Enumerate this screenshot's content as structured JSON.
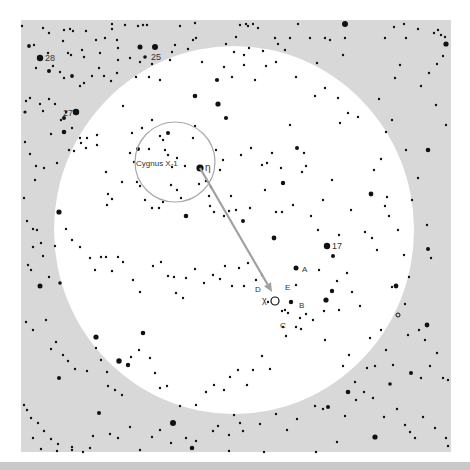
{
  "colors": {
    "sky_field": "#d8d8d8",
    "view_circle": "#ffffff",
    "star": "#111111",
    "marker_circle": "#a8a8a8",
    "arrow": "#a0a0a0",
    "label": "#333333",
    "bottom_strip": "#c9c9c9"
  },
  "field": {
    "x": 21,
    "y": 20,
    "width": 430,
    "height": 432
  },
  "view_circle": {
    "cx": 234,
    "cy": 230,
    "rx": 180,
    "ry": 184
  },
  "cygnus_circle": {
    "cx": 175,
    "cy": 162,
    "r": 40
  },
  "motion_arrow": {
    "x1": 200,
    "y1": 168,
    "x2": 272,
    "y2": 292
  },
  "labels": {
    "star_28": "28",
    "star_25": "25",
    "star_27": "27",
    "star_17": "17",
    "cygnus_x1": "Cygnus X-1",
    "eta": "η",
    "chi": "χ",
    "A": "A",
    "B": "B",
    "C": "C",
    "D": "D",
    "E": "E"
  },
  "label_positions": {
    "star_28": {
      "x": 45,
      "y": 61,
      "size": 9
    },
    "star_25": {
      "x": 151,
      "y": 60,
      "size": 9
    },
    "star_27": {
      "x": 63,
      "y": 116,
      "size": 9
    },
    "star_17": {
      "x": 332,
      "y": 249,
      "size": 9
    },
    "cygnus_x1": {
      "x": 136,
      "y": 166,
      "size": 8
    },
    "eta": {
      "x": 205,
      "y": 171,
      "size": 10
    },
    "chi": {
      "x": 262,
      "y": 303,
      "size": 9
    },
    "A": {
      "x": 302,
      "y": 272,
      "size": 8
    },
    "B": {
      "x": 299,
      "y": 308,
      "size": 8
    },
    "C": {
      "x": 280,
      "y": 328,
      "size": 8
    },
    "D": {
      "x": 255,
      "y": 292,
      "size": 8
    },
    "E": {
      "x": 285,
      "y": 290,
      "size": 8
    }
  },
  "chi_marker": {
    "cx": 275,
    "cy": 301,
    "r": 4
  },
  "open_star": {
    "cx": 398,
    "cy": 315,
    "r": 2
  },
  "bright_stars": [
    [
      40,
      58,
      3.2
    ],
    [
      155,
      47,
      3
    ],
    [
      76,
      112,
      3.2
    ],
    [
      200,
      168,
      3.6
    ],
    [
      327,
      246,
      3.2
    ],
    [
      296,
      268,
      2.5
    ],
    [
      326,
      300,
      2.6
    ],
    [
      291,
      302,
      2.2
    ],
    [
      345,
      24,
      3
    ],
    [
      446,
      44,
      2.6
    ],
    [
      428,
      150,
      2.3
    ],
    [
      371,
      194,
      2.4
    ],
    [
      333,
      256,
      2
    ],
    [
      140,
      47,
      2.5
    ],
    [
      64,
      118,
      2
    ],
    [
      218,
      104,
      2.6
    ],
    [
      195,
      96,
      2.3
    ],
    [
      59,
      212,
      2.6
    ],
    [
      40,
      286,
      2.5
    ],
    [
      96,
      337,
      2.6
    ],
    [
      119,
      361,
      2.7
    ],
    [
      173,
      423,
      3
    ],
    [
      99,
      413,
      2
    ],
    [
      192,
      448,
      2.3
    ],
    [
      375,
      437,
      2.6
    ],
    [
      348,
      392,
      2.3
    ],
    [
      396,
      286,
      2.4
    ],
    [
      427,
      325,
      2.4
    ],
    [
      332,
      291,
      2.2
    ],
    [
      168,
      133,
      2
    ],
    [
      138,
      149,
      2
    ],
    [
      60,
      283,
      1.8
    ],
    [
      274,
      238,
      2.4
    ],
    [
      186,
      216,
      2.3
    ],
    [
      243,
      221,
      2
    ],
    [
      297,
      148,
      2
    ],
    [
      283,
      183,
      2.2
    ],
    [
      59,
      378,
      2
    ],
    [
      128,
      365,
      2.2
    ],
    [
      143,
      333,
      2.3
    ],
    [
      328,
      407,
      2
    ],
    [
      411,
      373,
      2
    ],
    [
      428,
      249,
      2
    ],
    [
      390,
      384,
      1.8
    ],
    [
      64,
      132,
      2.3
    ],
    [
      49,
      71,
      2
    ],
    [
      72,
      76,
      1.9
    ],
    [
      226,
      118,
      2.1
    ],
    [
      217,
      80,
      2.1
    ],
    [
      145,
      57,
      1.8
    ],
    [
      29,
      46,
      1.9
    ],
    [
      25,
      112,
      1.6
    ]
  ],
  "stars": [
    [
      22,
      26
    ],
    [
      43,
      28
    ],
    [
      49,
      33
    ],
    [
      64,
      30
    ],
    [
      70,
      29
    ],
    [
      73,
      31
    ],
    [
      86,
      31
    ],
    [
      112,
      24
    ],
    [
      112,
      29
    ],
    [
      125,
      25
    ],
    [
      138,
      26
    ],
    [
      143,
      25
    ],
    [
      147,
      25
    ],
    [
      180,
      26
    ],
    [
      195,
      23
    ],
    [
      196,
      38
    ],
    [
      240,
      25
    ],
    [
      246,
      24
    ],
    [
      248,
      26
    ],
    [
      253,
      24
    ],
    [
      258,
      28
    ],
    [
      298,
      24
    ],
    [
      275,
      38
    ],
    [
      310,
      38
    ],
    [
      325,
      38
    ],
    [
      330,
      40
    ],
    [
      345,
      38
    ],
    [
      385,
      38
    ],
    [
      394,
      27
    ],
    [
      404,
      24
    ],
    [
      406,
      38
    ],
    [
      418,
      29
    ],
    [
      434,
      33
    ],
    [
      438,
      30
    ],
    [
      441,
      35
    ],
    [
      445,
      37
    ],
    [
      34,
      45
    ],
    [
      48,
      53
    ],
    [
      63,
      41
    ],
    [
      68,
      53
    ],
    [
      82,
      50
    ],
    [
      84,
      57
    ],
    [
      71,
      55
    ],
    [
      96,
      40
    ],
    [
      100,
      53
    ],
    [
      105,
      38
    ],
    [
      117,
      40
    ],
    [
      118,
      48
    ],
    [
      140,
      62
    ],
    [
      175,
      45
    ],
    [
      188,
      49
    ],
    [
      193,
      40
    ],
    [
      226,
      44
    ],
    [
      234,
      52
    ],
    [
      236,
      37
    ],
    [
      244,
      55
    ],
    [
      249,
      48
    ],
    [
      263,
      51
    ],
    [
      278,
      44
    ],
    [
      285,
      50
    ],
    [
      290,
      38
    ],
    [
      317,
      63
    ],
    [
      325,
      88
    ],
    [
      343,
      55
    ],
    [
      400,
      65
    ],
    [
      395,
      78
    ],
    [
      443,
      56
    ],
    [
      437,
      64
    ],
    [
      436,
      105
    ],
    [
      446,
      125
    ],
    [
      429,
      73
    ],
    [
      421,
      86
    ],
    [
      36,
      68
    ],
    [
      53,
      66
    ],
    [
      60,
      72
    ],
    [
      64,
      78
    ],
    [
      80,
      86
    ],
    [
      84,
      83
    ],
    [
      92,
      76
    ],
    [
      99,
      68
    ],
    [
      104,
      76
    ],
    [
      111,
      81
    ],
    [
      117,
      73
    ],
    [
      136,
      77
    ],
    [
      149,
      77
    ],
    [
      160,
      80
    ],
    [
      170,
      60
    ],
    [
      172,
      52
    ],
    [
      130,
      58
    ],
    [
      118,
      60
    ],
    [
      152,
      64
    ],
    [
      202,
      62
    ],
    [
      224,
      67
    ],
    [
      232,
      77
    ],
    [
      244,
      65
    ],
    [
      255,
      80
    ],
    [
      266,
      66
    ],
    [
      276,
      62
    ],
    [
      296,
      77
    ],
    [
      315,
      96
    ],
    [
      338,
      98
    ],
    [
      340,
      123
    ],
    [
      348,
      113
    ],
    [
      358,
      117
    ],
    [
      379,
      99
    ],
    [
      392,
      120
    ],
    [
      386,
      132
    ],
    [
      406,
      150
    ],
    [
      418,
      178
    ],
    [
      412,
      200
    ],
    [
      427,
      225
    ],
    [
      431,
      258
    ],
    [
      409,
      277
    ],
    [
      26,
      101
    ],
    [
      30,
      98
    ],
    [
      40,
      104
    ],
    [
      49,
      99
    ],
    [
      43,
      111
    ],
    [
      55,
      104
    ],
    [
      61,
      120
    ],
    [
      66,
      112
    ],
    [
      72,
      128
    ],
    [
      80,
      138
    ],
    [
      87,
      138
    ],
    [
      97,
      135
    ],
    [
      123,
      106
    ],
    [
      132,
      133
    ],
    [
      142,
      128
    ],
    [
      149,
      149
    ],
    [
      152,
      120
    ],
    [
      160,
      136
    ],
    [
      163,
      140
    ],
    [
      165,
      150
    ],
    [
      168,
      155
    ],
    [
      172,
      167
    ],
    [
      177,
      158
    ],
    [
      185,
      166
    ],
    [
      193,
      138
    ],
    [
      195,
      126
    ],
    [
      206,
      181
    ],
    [
      209,
      196
    ],
    [
      211,
      187
    ],
    [
      216,
      150
    ],
    [
      220,
      170
    ],
    [
      223,
      160
    ],
    [
      231,
      196
    ],
    [
      241,
      155
    ],
    [
      251,
      148
    ],
    [
      262,
      165
    ],
    [
      267,
      163
    ],
    [
      272,
      153
    ],
    [
      281,
      168
    ],
    [
      290,
      125
    ],
    [
      304,
      153
    ],
    [
      306,
      166
    ],
    [
      302,
      172
    ],
    [
      323,
      200
    ],
    [
      332,
      180
    ],
    [
      339,
      235
    ],
    [
      347,
      273
    ],
    [
      374,
      170
    ],
    [
      381,
      159
    ],
    [
      387,
      197
    ],
    [
      385,
      206
    ],
    [
      389,
      216
    ],
    [
      398,
      230
    ],
    [
      404,
      255
    ],
    [
      25,
      142
    ],
    [
      30,
      154
    ],
    [
      36,
      166
    ],
    [
      35,
      180
    ],
    [
      24,
      198
    ],
    [
      44,
      168
    ],
    [
      51,
      134
    ],
    [
      57,
      163
    ],
    [
      69,
      150
    ],
    [
      74,
      151
    ],
    [
      81,
      143
    ],
    [
      86,
      148
    ],
    [
      97,
      145
    ],
    [
      106,
      172
    ],
    [
      108,
      194
    ],
    [
      107,
      205
    ],
    [
      112,
      199
    ],
    [
      122,
      182
    ],
    [
      130,
      153
    ],
    [
      134,
      162
    ],
    [
      137,
      182
    ],
    [
      140,
      186
    ],
    [
      145,
      200
    ],
    [
      152,
      208
    ],
    [
      159,
      208
    ],
    [
      163,
      202
    ],
    [
      171,
      185
    ],
    [
      177,
      190
    ],
    [
      181,
      198
    ],
    [
      199,
      184
    ],
    [
      210,
      206
    ],
    [
      214,
      212
    ],
    [
      224,
      216
    ],
    [
      229,
      211
    ],
    [
      236,
      210
    ],
    [
      250,
      208
    ],
    [
      265,
      190
    ],
    [
      276,
      212
    ],
    [
      282,
      212
    ],
    [
      293,
      205
    ],
    [
      311,
      216
    ],
    [
      318,
      230
    ],
    [
      351,
      210
    ],
    [
      365,
      232
    ],
    [
      372,
      238
    ],
    [
      377,
      250
    ],
    [
      27,
      221
    ],
    [
      33,
      229
    ],
    [
      37,
      230
    ],
    [
      41,
      243
    ],
    [
      43,
      256
    ],
    [
      33,
      247
    ],
    [
      28,
      265
    ],
    [
      31,
      270
    ],
    [
      49,
      277
    ],
    [
      55,
      246
    ],
    [
      66,
      229
    ],
    [
      72,
      240
    ],
    [
      80,
      247
    ],
    [
      90,
      258
    ],
    [
      95,
      270
    ],
    [
      101,
      257
    ],
    [
      106,
      257
    ],
    [
      112,
      271
    ],
    [
      118,
      257
    ],
    [
      123,
      262
    ],
    [
      133,
      280
    ],
    [
      140,
      292
    ],
    [
      153,
      266
    ],
    [
      161,
      262
    ],
    [
      168,
      276
    ],
    [
      174,
      277
    ],
    [
      176,
      293
    ],
    [
      183,
      298
    ],
    [
      186,
      278
    ],
    [
      195,
      269
    ],
    [
      204,
      283
    ],
    [
      213,
      275
    ],
    [
      220,
      279
    ],
    [
      225,
      266
    ],
    [
      232,
      286
    ],
    [
      239,
      268
    ],
    [
      244,
      286
    ],
    [
      248,
      263
    ],
    [
      256,
      280
    ],
    [
      262,
      275
    ],
    [
      268,
      302
    ],
    [
      282,
      311
    ],
    [
      285,
      310
    ],
    [
      296,
      285
    ],
    [
      300,
      318
    ],
    [
      306,
      314
    ],
    [
      319,
      270
    ],
    [
      324,
      311
    ],
    [
      337,
      281
    ],
    [
      339,
      310
    ],
    [
      352,
      292
    ],
    [
      360,
      306
    ],
    [
      370,
      338
    ],
    [
      392,
      287
    ],
    [
      405,
      304
    ],
    [
      408,
      335
    ],
    [
      419,
      330
    ],
    [
      425,
      340
    ],
    [
      26,
      322
    ],
    [
      33,
      330
    ],
    [
      46,
      320
    ],
    [
      51,
      349
    ],
    [
      56,
      342
    ],
    [
      63,
      355
    ],
    [
      68,
      361
    ],
    [
      75,
      369
    ],
    [
      87,
      371
    ],
    [
      96,
      348
    ],
    [
      101,
      360
    ],
    [
      107,
      372
    ],
    [
      108,
      386
    ],
    [
      115,
      390
    ],
    [
      122,
      395
    ],
    [
      131,
      357
    ],
    [
      139,
      350
    ],
    [
      150,
      358
    ],
    [
      155,
      373
    ],
    [
      160,
      388
    ],
    [
      167,
      386
    ],
    [
      180,
      406
    ],
    [
      196,
      405
    ],
    [
      206,
      392
    ],
    [
      214,
      385
    ],
    [
      224,
      390
    ],
    [
      230,
      377
    ],
    [
      238,
      370
    ],
    [
      247,
      385
    ],
    [
      253,
      370
    ],
    [
      262,
      356
    ],
    [
      270,
      369
    ],
    [
      283,
      327
    ],
    [
      286,
      336
    ],
    [
      288,
      313
    ],
    [
      296,
      327
    ],
    [
      301,
      329
    ],
    [
      313,
      320
    ],
    [
      325,
      340
    ],
    [
      343,
      366
    ],
    [
      349,
      355
    ],
    [
      355,
      382
    ],
    [
      367,
      368
    ],
    [
      375,
      366
    ],
    [
      381,
      330
    ],
    [
      386,
      350
    ],
    [
      393,
      365
    ],
    [
      421,
      378
    ],
    [
      430,
      366
    ],
    [
      437,
      353
    ],
    [
      443,
      378
    ],
    [
      448,
      380
    ],
    [
      24,
      405
    ],
    [
      27,
      410
    ],
    [
      31,
      418
    ],
    [
      38,
      423
    ],
    [
      44,
      431
    ],
    [
      51,
      439
    ],
    [
      58,
      444
    ],
    [
      72,
      447
    ],
    [
      83,
      452
    ],
    [
      90,
      448
    ],
    [
      110,
      434
    ],
    [
      118,
      438
    ],
    [
      130,
      427
    ],
    [
      152,
      437
    ],
    [
      160,
      430
    ],
    [
      171,
      443
    ],
    [
      186,
      438
    ],
    [
      196,
      441
    ],
    [
      213,
      431
    ],
    [
      218,
      426
    ],
    [
      229,
      435
    ],
    [
      234,
      415
    ],
    [
      240,
      423
    ],
    [
      260,
      424
    ],
    [
      276,
      414
    ],
    [
      287,
      430
    ],
    [
      297,
      419
    ],
    [
      315,
      406
    ],
    [
      323,
      409
    ],
    [
      345,
      416
    ],
    [
      356,
      400
    ],
    [
      364,
      392
    ],
    [
      373,
      398
    ],
    [
      384,
      417
    ],
    [
      397,
      409
    ],
    [
      405,
      425
    ],
    [
      410,
      432
    ],
    [
      415,
      438
    ],
    [
      423,
      417
    ],
    [
      435,
      428
    ],
    [
      446,
      438
    ],
    [
      448,
      446
    ],
    [
      337,
      442
    ],
    [
      316,
      452
    ],
    [
      264,
      452
    ],
    [
      243,
      431
    ],
    [
      229,
      451
    ],
    [
      140,
      450
    ],
    [
      93,
      436
    ],
    [
      72,
      450
    ],
    [
      57,
      451
    ],
    [
      41,
      449
    ],
    [
      33,
      438
    ]
  ]
}
